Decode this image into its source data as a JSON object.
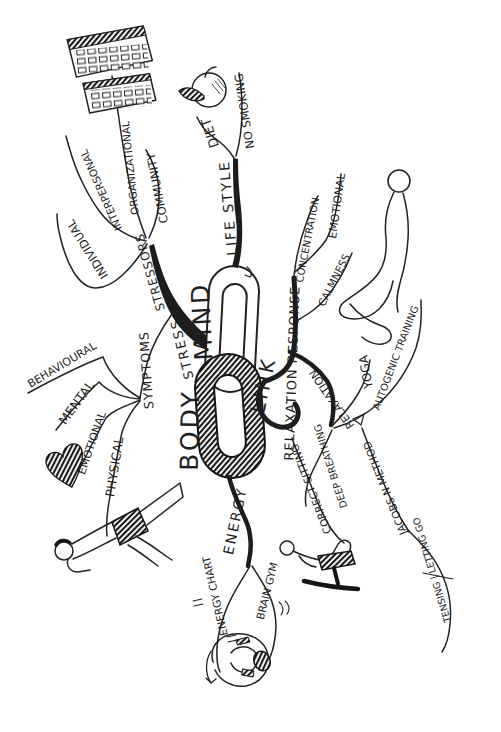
{
  "paper_color": "#ffffff",
  "ink_color": "#1f1f1f",
  "center": {
    "mind": "MIND",
    "body": "BODY",
    "link": "LINK"
  },
  "branches": {
    "stress": {
      "trunk": "STRESS",
      "hub": "STRESSORS",
      "children": {
        "individual": "INDIVIDUAL",
        "interpersonal": "INTERPERSONAL",
        "organizational": "ORGANIZATIONAL",
        "community": "COMMUNITY"
      }
    },
    "symptoms": {
      "hub": "SYMPTOMS",
      "children": {
        "behavioural": "BEHAVIOURAL",
        "mental": "MENTAL",
        "emotional": "EMOTIONAL",
        "physical": "PHYSICAL"
      }
    },
    "lifestyle": {
      "hub": "LIFE STYLE",
      "children": {
        "diet": "DIET",
        "no_smoking": "NO SMOKING"
      }
    },
    "relaxation_response": {
      "hub": "RELAXATION RESPONSE",
      "children": {
        "concentration": "CONCENTRATION",
        "emotional": "EMOTIONAL",
        "calmness": "CALMNESS"
      }
    },
    "relaxation": {
      "hub": "RELAXATION",
      "children": {
        "yoga": "YOGA",
        "autogenic_training": "AUTOGENIC TRAINING",
        "deep_breathing": "DEEP BREATHING",
        "jacobson_method": "JACOBS N METHOD",
        "tensing_letting_go": "TENSING | LETTING GO",
        "correct_sitting": "CORRECT SITTING"
      }
    },
    "energy": {
      "hub": "ENERGY",
      "children": {
        "energy_chart": "ENERGY CHART",
        "brain_gym": "BRAIN GYM"
      }
    }
  },
  "icons": {
    "chain": "interlocked-chain-links-sketch",
    "keyboards": "two-keyboards-sketch",
    "apple": "apple-with-leaf-sketch",
    "heart": "heart-sketch",
    "meditating_figure": "kneeling-meditation-figure-sketch",
    "stool_figure": "figure-on-kneeling-stool-sketch",
    "exercise_figure": "leg-raise-exercise-figure-sketch",
    "somersault_figure": "rolling-somersault-figure-sketch"
  }
}
